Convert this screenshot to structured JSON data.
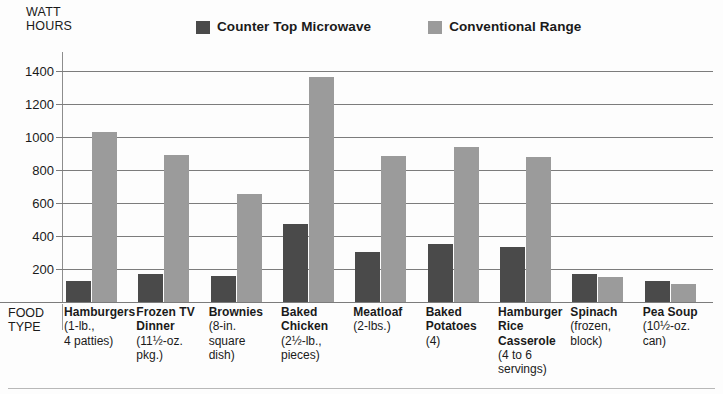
{
  "axis": {
    "y_unit_caption": "WATT\nHOURS",
    "food_type_caption": "FOOD\nTYPE"
  },
  "legend": {
    "items": [
      {
        "label": "Counter Top Microwave",
        "color": "#4a4a4a",
        "icon": "legend-swatch-icon"
      },
      {
        "label": "Conventional Range",
        "color": "#9b9b9b",
        "icon": "legend-swatch-icon"
      }
    ]
  },
  "chart_data": {
    "type": "bar",
    "title": "",
    "xlabel": "FOOD TYPE",
    "ylabel": "WATT HOURS",
    "ylim": [
      0,
      1500
    ],
    "yticks": [
      200,
      400,
      600,
      800,
      1000,
      1200,
      1400
    ],
    "ytick_labels": [
      "200",
      "400",
      "600",
      "800",
      "1000",
      "1200",
      "1400"
    ],
    "grid": true,
    "legend_position": "top",
    "categories": [
      "Hamburgers",
      "Frozen TV Dinner",
      "Brownies",
      "Baked Chicken",
      "Meatloaf",
      "Baked Potatoes",
      "Hamburger Rice Casserole",
      "Spinach",
      "Pea Soup"
    ],
    "category_details": [
      "(1-lb.,\n4 patties)",
      "(11½-oz.\npkg.)",
      "(8-in.\nsquare\ndish)",
      "(2½-lb.,\npieces)",
      "(2-lbs.)",
      "(4)",
      "(4 to 6\nservings)",
      "(frozen,\nblock)",
      "(10½-oz.\ncan)"
    ],
    "series": [
      {
        "name": "Counter Top Microwave",
        "color": "#4a4a4a",
        "values": [
          130,
          170,
          155,
          470,
          300,
          350,
          330,
          170,
          125
        ]
      },
      {
        "name": "Conventional Range",
        "color": "#9b9b9b",
        "values": [
          1030,
          890,
          655,
          1360,
          885,
          940,
          880,
          150,
          110
        ]
      }
    ]
  }
}
